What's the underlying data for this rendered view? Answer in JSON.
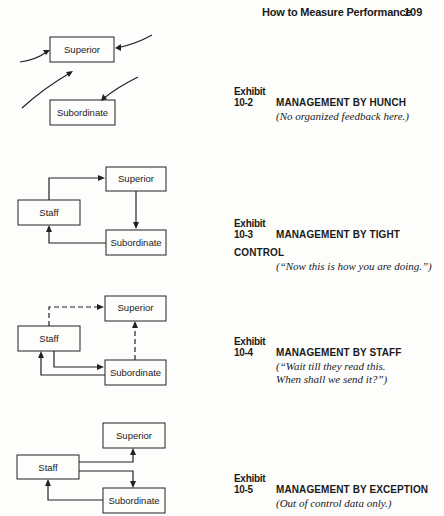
{
  "header": {
    "running_title": "How to Measure Performance",
    "page_number": "109"
  },
  "exhibits": [
    {
      "number": "Exhibit 10-2",
      "title": "MANAGEMENT BY HUNCH",
      "subtitle": [
        "(No organized feedback here.)"
      ],
      "boxes": {
        "superior": "Superior",
        "subordinate": "Subordinate"
      }
    },
    {
      "number": "Exhibit 10-3",
      "title": "MANAGEMENT BY TIGHT CONTROL",
      "subtitle": [
        "(“Now this is how you are doing.”)"
      ],
      "boxes": {
        "superior": "Superior",
        "staff": "Staff",
        "subordinate": "Subordinate"
      }
    },
    {
      "number": "Exhibit 10-4",
      "title": "MANAGEMENT BY STAFF",
      "subtitle": [
        "(“Wait till they read this.",
        "When shall we send it?”)"
      ],
      "boxes": {
        "superior": "Superior",
        "staff": "Staff",
        "subordinate": "Subordinate"
      }
    },
    {
      "number": "Exhibit 10-5",
      "title": "MANAGEMENT BY EXCEPTION",
      "subtitle": [
        "(Out of control data only.)"
      ],
      "boxes": {
        "superior": "Superior",
        "staff": "Staff",
        "subordinate": "Subordinate"
      }
    }
  ]
}
